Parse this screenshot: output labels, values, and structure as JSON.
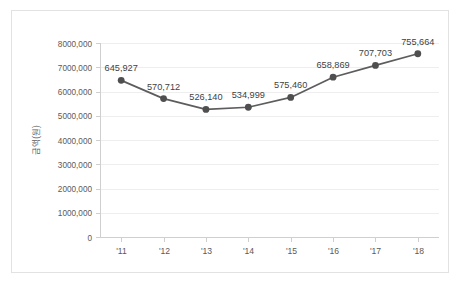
{
  "chart_data": {
    "type": "line",
    "title": "",
    "xlabel": "",
    "ylabel": "금액(원)",
    "categories": [
      "'11",
      "'12",
      "'13",
      "'14",
      "'15",
      "'16",
      "'17",
      "'18"
    ],
    "values": [
      6459270,
      5707120,
      5261400,
      5349990,
      5754600,
      6588690,
      7077030,
      7556640
    ],
    "point_labels": [
      "645,927",
      "570,712",
      "526,140",
      "534,999",
      "575,460",
      "658,869",
      "707,703",
      "755,664"
    ],
    "ylim": [
      0,
      8000000
    ],
    "ytick_values": [
      0,
      1000000,
      2000000,
      3000000,
      4000000,
      5000000,
      6000000,
      7000000,
      8000000
    ],
    "ytick_labels": [
      "0",
      "1000,000",
      "2000,000",
      "3000,000",
      "4000,000",
      "5000,000",
      "6000,000",
      "7000,000",
      "8000,000"
    ],
    "grid": true,
    "legend": false,
    "series_color": "#5d5d5d",
    "marker_color": "#4f4f4f",
    "gridline_color": "#eeeeee",
    "axis_color": "#cfcfcf",
    "border_color": "#e2e2e2",
    "background": "#ffffff"
  }
}
